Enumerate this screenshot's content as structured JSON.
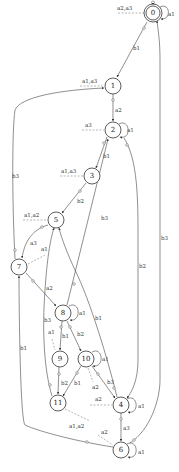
{
  "diagram": {
    "title": "",
    "states": [
      {
        "id": "0",
        "label": "0",
        "x": 153,
        "y": 13,
        "initial": true,
        "accepting": true
      },
      {
        "id": "1",
        "label": "1",
        "x": 113,
        "y": 86
      },
      {
        "id": "2",
        "label": "2",
        "x": 113,
        "y": 130
      },
      {
        "id": "3",
        "label": "3",
        "x": 92,
        "y": 176
      },
      {
        "id": "5",
        "label": "5",
        "x": 56,
        "y": 220
      },
      {
        "id": "7",
        "label": "7",
        "x": 19,
        "y": 267
      },
      {
        "id": "8",
        "label": "8",
        "x": 63,
        "y": 313
      },
      {
        "id": "9",
        "label": "9",
        "x": 60,
        "y": 359
      },
      {
        "id": "10",
        "label": "10",
        "x": 86,
        "y": 359
      },
      {
        "id": "11",
        "label": "11",
        "x": 58,
        "y": 403
      },
      {
        "id": "4",
        "label": "4",
        "x": 121,
        "y": 405
      },
      {
        "id": "6",
        "label": "6",
        "x": 121,
        "y": 450
      }
    ],
    "transitions": [
      {
        "from": "0",
        "to": "0",
        "label": "a1"
      },
      {
        "from": "0",
        "to": "1",
        "label": "b1"
      },
      {
        "from": "1",
        "to": "2",
        "label": "a2"
      },
      {
        "from": "2",
        "to": "2",
        "label": "a1"
      },
      {
        "from": "2",
        "to": "3",
        "label": "b1"
      },
      {
        "from": "2",
        "to": "4",
        "label": "b2"
      },
      {
        "from": "3",
        "to": "5",
        "label": "b2"
      },
      {
        "from": "5",
        "to": "7",
        "label": "a3"
      },
      {
        "from": "7",
        "to": "1",
        "label": "b3"
      },
      {
        "from": "7",
        "to": "8",
        "label": "a2"
      },
      {
        "from": "8",
        "to": "8",
        "label": "a1"
      },
      {
        "from": "8",
        "to": "2",
        "label": "b3"
      },
      {
        "from": "8",
        "to": "9",
        "label": "b1"
      },
      {
        "from": "8",
        "to": "10",
        "label": "b2"
      },
      {
        "from": "9",
        "to": "11",
        "label": "b2"
      },
      {
        "from": "10",
        "to": "10",
        "label": "a1"
      },
      {
        "from": "10",
        "to": "11",
        "label": "b1"
      },
      {
        "from": "10",
        "to": "4",
        "label": "b3"
      },
      {
        "from": "11",
        "to": "5",
        "label": "b3"
      },
      {
        "from": "4",
        "to": "4",
        "label": "a1"
      },
      {
        "from": "4",
        "to": "5",
        "label": "b1"
      },
      {
        "from": "4",
        "to": "6",
        "label": "a3"
      },
      {
        "from": "6",
        "to": "6",
        "label": "a1"
      },
      {
        "from": "6",
        "to": "0",
        "label": "b3"
      },
      {
        "from": "6",
        "to": "7",
        "label": "b1"
      }
    ],
    "observations": [
      {
        "state": "0",
        "label": "a2,a3"
      },
      {
        "state": "1",
        "label": "a1,a3"
      },
      {
        "state": "2",
        "label": "a3"
      },
      {
        "state": "3",
        "label": "a1,a3"
      },
      {
        "state": "5",
        "label": "a1,a2"
      },
      {
        "state": "7",
        "label": "a1"
      },
      {
        "state": "9",
        "label": "a1"
      },
      {
        "state": "10",
        "label": "a2"
      },
      {
        "state": "4",
        "label": "a2"
      },
      {
        "state": "11",
        "label": "a1,a2"
      },
      {
        "state": "6",
        "label": "a2"
      }
    ],
    "colors": {
      "stroke": "#333333",
      "dashed": "#888888",
      "background": "#ffffff"
    }
  }
}
